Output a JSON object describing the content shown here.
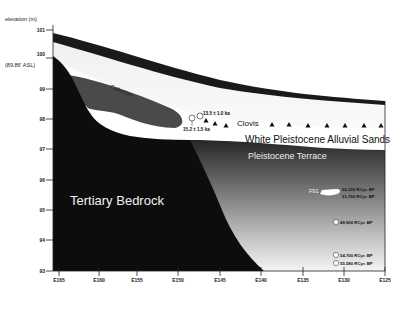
{
  "diagram": {
    "y_axis": {
      "title": "elevation (m)",
      "datum_note": "(89.86' ASL)",
      "ticks": [
        "101",
        "100",
        "99",
        "98",
        "97",
        "96",
        "95",
        "94",
        "93"
      ]
    },
    "x_axis": {
      "ticks": [
        "E165",
        "E160",
        "E155",
        "E150",
        "E145",
        "E140",
        "E135",
        "E130",
        "E125"
      ]
    },
    "units": {
      "colluvium": "Colluvium",
      "clovis": "Clovis",
      "white_sands": "White Pleistocene Alluvial Sands",
      "terrace": "Pleistocene Terrace",
      "bedrock": "Tertiary Bedrock"
    },
    "samples": {
      "osl_upper": "13.5 ± 1.0 ka",
      "osl_lower": "15.2 ± 1.5 ka",
      "feature_label": "F91",
      "feature_dates": [
        "50,330 RCyr. BP",
        "51,700 RCyr. BP"
      ],
      "mid_date": "49,900 RCyr. BP",
      "low_dates": [
        "54,700 RCyr. BP",
        "55,580 RCyr. BP"
      ]
    },
    "colors": {
      "bedrock": "#0d0d0d",
      "colluvium": "#4a4a4a",
      "sand": "#ffffff",
      "upper_soil": "#ececec",
      "top_band": "#1a1a1a"
    }
  }
}
